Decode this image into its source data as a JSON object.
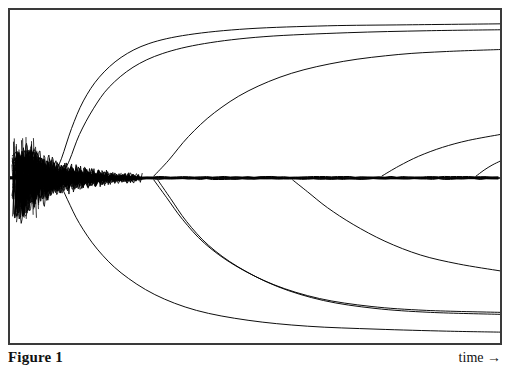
{
  "figure": {
    "caption_label": "Figure 1",
    "axis_label_x": "time →",
    "frame_color": "#3a3a3a",
    "background_color": "#ffffff",
    "trace_color": "#000000"
  },
  "chart_data": {
    "type": "line",
    "title": "Figure 1",
    "xlabel": "time →",
    "ylabel": "",
    "grid": false,
    "legend": "none",
    "axis_ticks": false,
    "xlim": [
      0,
      494
    ],
    "ylim": [
      0,
      337
    ],
    "chaotic_bundle": {
      "x_start": 2,
      "x_end": 135,
      "y_center": 170,
      "y_spread_max": 42,
      "y_spread_min": 2,
      "n_traces": 46,
      "oscillation_density": "high"
    },
    "central_band": {
      "y": 170,
      "x_start": 0,
      "x_end": 494,
      "thickness": 3
    },
    "series": [
      {
        "name": "upper-branch-1",
        "direction": "up",
        "departure_x": 44,
        "points": [
          [
            44,
            168
          ],
          [
            52,
            150
          ],
          [
            62,
            120
          ],
          [
            74,
            92
          ],
          [
            90,
            68
          ],
          [
            112,
            48
          ],
          [
            140,
            34
          ],
          [
            180,
            25
          ],
          [
            240,
            19
          ],
          [
            320,
            16
          ],
          [
            400,
            15
          ],
          [
            494,
            14
          ]
        ]
      },
      {
        "name": "upper-branch-2",
        "direction": "up",
        "departure_x": 52,
        "points": [
          [
            52,
            168
          ],
          [
            60,
            152
          ],
          [
            70,
            126
          ],
          [
            84,
            100
          ],
          [
            100,
            78
          ],
          [
            124,
            58
          ],
          [
            154,
            44
          ],
          [
            196,
            34
          ],
          [
            256,
            27
          ],
          [
            340,
            23
          ],
          [
            420,
            21
          ],
          [
            494,
            20
          ]
        ]
      },
      {
        "name": "upper-branch-3",
        "direction": "up",
        "departure_x": 145,
        "points": [
          [
            145,
            168
          ],
          [
            160,
            152
          ],
          [
            180,
            128
          ],
          [
            206,
            104
          ],
          [
            240,
            82
          ],
          [
            284,
            64
          ],
          [
            336,
            52
          ],
          [
            392,
            45
          ],
          [
            440,
            42
          ],
          [
            494,
            40
          ]
        ]
      },
      {
        "name": "upper-branch-4",
        "direction": "up",
        "departure_x": 375,
        "points": [
          [
            375,
            168
          ],
          [
            392,
            158
          ],
          [
            412,
            148
          ],
          [
            436,
            139
          ],
          [
            462,
            132
          ],
          [
            494,
            126
          ]
        ]
      },
      {
        "name": "upper-branch-5",
        "direction": "up",
        "departure_x": 470,
        "points": [
          [
            470,
            168
          ],
          [
            478,
            162
          ],
          [
            486,
            157
          ],
          [
            494,
            153
          ]
        ]
      },
      {
        "name": "lower-branch-1",
        "direction": "down",
        "departure_x": 49,
        "points": [
          [
            49,
            172
          ],
          [
            58,
            192
          ],
          [
            70,
            216
          ],
          [
            88,
            242
          ],
          [
            112,
            266
          ],
          [
            146,
            288
          ],
          [
            188,
            304
          ],
          [
            240,
            314
          ],
          [
            300,
            320
          ],
          [
            370,
            323
          ],
          [
            440,
            325
          ],
          [
            494,
            326
          ]
        ]
      },
      {
        "name": "lower-branch-2",
        "direction": "down",
        "departure_x": 145,
        "points": [
          [
            145,
            172
          ],
          [
            158,
            190
          ],
          [
            174,
            212
          ],
          [
            196,
            236
          ],
          [
            226,
            258
          ],
          [
            266,
            278
          ],
          [
            312,
            292
          ],
          [
            364,
            300
          ],
          [
            420,
            304
          ],
          [
            494,
            306
          ]
        ]
      },
      {
        "name": "lower-branch-3",
        "direction": "down",
        "departure_x": 149,
        "points": [
          [
            149,
            172
          ],
          [
            162,
            191
          ],
          [
            178,
            214
          ],
          [
            200,
            238
          ],
          [
            230,
            260
          ],
          [
            270,
            280
          ],
          [
            316,
            294
          ],
          [
            368,
            302
          ],
          [
            424,
            306
          ],
          [
            494,
            308
          ]
        ]
      },
      {
        "name": "lower-branch-4",
        "direction": "down",
        "departure_x": 285,
        "points": [
          [
            285,
            172
          ],
          [
            300,
            184
          ],
          [
            320,
            200
          ],
          [
            346,
            217
          ],
          [
            378,
            234
          ],
          [
            414,
            248
          ],
          [
            452,
            257
          ],
          [
            494,
            264
          ]
        ]
      }
    ]
  }
}
